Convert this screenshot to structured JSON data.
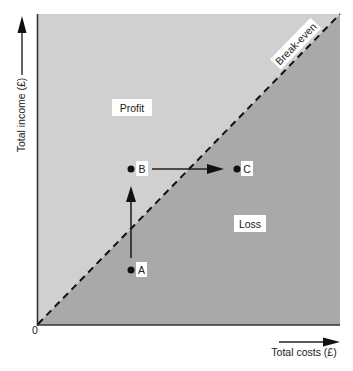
{
  "diagram": {
    "type": "break-even chart",
    "axes": {
      "x_label": "Total costs (£)",
      "y_label": "Total income (£)",
      "origin_label": "0"
    },
    "regions": [
      {
        "name": "profit",
        "label": "Profit",
        "color": "#d0d0d0"
      },
      {
        "name": "loss",
        "label": "Loss",
        "color": "#a9a9a9"
      }
    ],
    "break_even_line": {
      "label": "Break-even",
      "style": "dashed"
    },
    "points": [
      {
        "id": "A",
        "label": "A"
      },
      {
        "id": "B",
        "label": "B"
      },
      {
        "id": "C",
        "label": "C"
      }
    ],
    "arrows": [
      {
        "from": "A",
        "to": "B",
        "direction": "up"
      },
      {
        "from": "B",
        "to": "C",
        "direction": "right"
      }
    ]
  }
}
